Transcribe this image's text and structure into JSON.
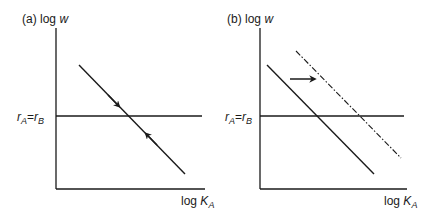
{
  "panels": [
    {
      "id": "a",
      "tag": "(a)",
      "y_axis_label": "log w",
      "y_axis_label_prefix": "log",
      "y_axis_label_var": "w",
      "x_axis_label_prefix": "log",
      "x_axis_label_var": "K",
      "x_axis_label_sub": "A",
      "hline_label_r1": "r",
      "hline_label_sub1": "A",
      "hline_label_eq": "=",
      "hline_label_r2": "r",
      "hline_label_sub2": "B",
      "description": "Downward-sloping line crossing r_A = r_B with arrows converging toward the intersection (stable equilibrium)"
    },
    {
      "id": "b",
      "tag": "(b)",
      "y_axis_label_prefix": "log",
      "y_axis_label_var": "w",
      "x_axis_label_prefix": "log",
      "x_axis_label_var": "K",
      "x_axis_label_sub": "A",
      "hline_label_r1": "r",
      "hline_label_sub1": "A",
      "hline_label_eq": "=",
      "hline_label_r2": "r",
      "hline_label_sub2": "B",
      "description": "Downward-sloping solid line shifts right to dash-dot line, indicated by rightward arrow"
    }
  ],
  "colors": {
    "line": "#1a1a1a",
    "background": "#ffffff"
  }
}
